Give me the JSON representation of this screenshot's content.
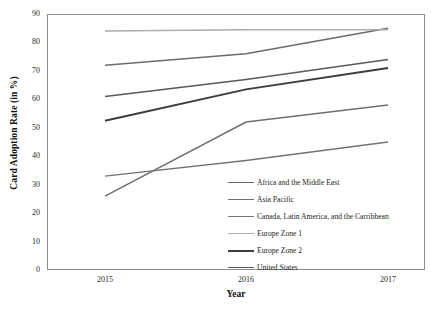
{
  "chart_data": {
    "type": "line",
    "title": "",
    "xlabel": "Year",
    "ylabel": "Card Adoption Rate (in %)",
    "categories": [
      "2015",
      "2016",
      "2017"
    ],
    "x": [
      2015,
      2016,
      2017
    ],
    "ylim": [
      0,
      90
    ],
    "yticks": [
      0,
      10,
      20,
      30,
      40,
      50,
      60,
      70,
      80,
      90
    ],
    "ytick_labels": [
      "0",
      "10",
      "20",
      "30",
      "40",
      "50",
      "60",
      "70",
      "80",
      "90"
    ],
    "grid": false,
    "legend_position": "inside-lower-right",
    "series": [
      {
        "name": "Africa and the Middle East",
        "values": [
          72,
          76,
          85
        ],
        "color": "#6b6b6b",
        "width": 1.6
      },
      {
        "name": "Asia Pacific",
        "values": [
          26,
          52,
          58
        ],
        "color": "#6f6f6f",
        "width": 1.5
      },
      {
        "name": "Canada, Latin America, and the Carribbean",
        "values": [
          33,
          38.5,
          45
        ],
        "color": "#737373",
        "width": 1.4
      },
      {
        "name": "Europe Zone 1",
        "values": [
          84,
          84.5,
          84.5
        ],
        "color": "#adadad",
        "width": 1.5
      },
      {
        "name": "Europe Zone 2",
        "values": [
          52.5,
          63.5,
          71
        ],
        "color": "#3d3d3d",
        "width": 2.0
      },
      {
        "name": "United States",
        "values": [
          61,
          67,
          74
        ],
        "color": "#585858",
        "width": 1.6
      }
    ]
  },
  "axis": {
    "y_title": "Card Adoption Rate (in %)",
    "x_title": "Year"
  },
  "colors": {
    "frame": "#8d8d8d",
    "text": "#1a1a1a",
    "background": "#ffffff"
  }
}
